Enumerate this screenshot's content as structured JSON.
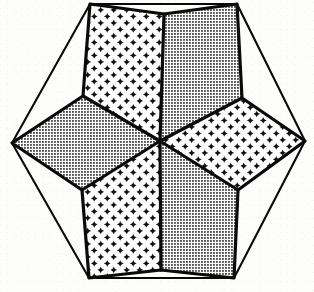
{
  "figure": {
    "type": "line-drawing",
    "width": 314,
    "height": 292,
    "background_color": "#fdfdfc",
    "ink_color": "#0a0a0a",
    "fill_background_color": "#ffffff",
    "outer_shape": {
      "name": "hexagon",
      "stroke_width_px": 2.1,
      "vertices": [
        {
          "label": "top-left",
          "x": 90,
          "y": 4
        },
        {
          "label": "top-right",
          "x": 237,
          "y": 4
        },
        {
          "label": "right",
          "x": 305,
          "y": 141
        },
        {
          "label": "bottom-right",
          "x": 234,
          "y": 278
        },
        {
          "label": "bottom-left",
          "x": 89,
          "y": 278
        },
        {
          "label": "left",
          "x": 12,
          "y": 143
        }
      ]
    },
    "inner_shape": {
      "name": "hexagram",
      "center": {
        "x": 160,
        "y": 141
      },
      "stroke_width_px": 3.2,
      "star_tips": [
        {
          "label": "tip-top-left",
          "x": 90,
          "y": 4
        },
        {
          "label": "tip-top-right",
          "x": 237,
          "y": 4
        },
        {
          "label": "tip-right",
          "x": 305,
          "y": 141
        },
        {
          "label": "tip-bottom-right",
          "x": 234,
          "y": 278
        },
        {
          "label": "tip-bottom-left",
          "x": 89,
          "y": 278
        },
        {
          "label": "tip-left",
          "x": 12,
          "y": 143
        }
      ],
      "inner_vertices": [
        {
          "label": "inner-top",
          "x": 164,
          "y": 14
        },
        {
          "label": "inner-upper-right",
          "x": 242,
          "y": 98
        },
        {
          "label": "inner-lower-right",
          "x": 238,
          "y": 190
        },
        {
          "label": "inner-bottom",
          "x": 161,
          "y": 270
        },
        {
          "label": "inner-lower-left",
          "x": 82,
          "y": 190
        },
        {
          "label": "inner-upper-left",
          "x": 83,
          "y": 96
        }
      ]
    },
    "rhombi": [
      {
        "id": "rhombus-upper-left",
        "label": "Upper left rhombus",
        "fill_pattern": "four-point-star",
        "points": [
          [
            160,
            141
          ],
          [
            83,
            96
          ],
          [
            90,
            4
          ],
          [
            164,
            14
          ]
        ]
      },
      {
        "id": "rhombus-upper-right",
        "label": "Upper right rhombus",
        "fill_pattern": "halftone-dot",
        "points": [
          [
            160,
            141
          ],
          [
            164,
            14
          ],
          [
            237,
            4
          ],
          [
            242,
            98
          ]
        ]
      },
      {
        "id": "rhombus-right",
        "label": "Right rhombus",
        "fill_pattern": "four-point-star",
        "points": [
          [
            160,
            141
          ],
          [
            242,
            98
          ],
          [
            305,
            141
          ],
          [
            238,
            190
          ]
        ]
      },
      {
        "id": "rhombus-lower-right",
        "label": "Lower right rhombus",
        "fill_pattern": "halftone-dot",
        "points": [
          [
            160,
            141
          ],
          [
            238,
            190
          ],
          [
            234,
            278
          ],
          [
            161,
            270
          ]
        ]
      },
      {
        "id": "rhombus-lower-left",
        "label": "Lower left rhombus",
        "fill_pattern": "four-point-star",
        "points": [
          [
            160,
            141
          ],
          [
            161,
            270
          ],
          [
            89,
            278
          ],
          [
            82,
            190
          ]
        ]
      },
      {
        "id": "rhombus-left",
        "label": "Left rhombus",
        "fill_pattern": "halftone-dot",
        "points": [
          [
            160,
            141
          ],
          [
            82,
            190
          ],
          [
            12,
            143
          ],
          [
            83,
            96
          ]
        ]
      }
    ],
    "thin_connector_lines": [
      {
        "id": "connector-left-to-inner-upper-left",
        "from": [
          12,
          143
        ],
        "to": [
          83,
          96
        ]
      },
      {
        "id": "connector-left-to-inner-lower-left",
        "from": [
          12,
          143
        ],
        "to": [
          82,
          190
        ]
      },
      {
        "id": "connector-right-to-inner-upper-right",
        "from": [
          305,
          141
        ],
        "to": [
          242,
          98
        ]
      },
      {
        "id": "connector-right-to-inner-lower-right",
        "from": [
          305,
          141
        ],
        "to": [
          238,
          190
        ]
      },
      {
        "id": "connector-top-left-to-inner-upper-left",
        "from": [
          90,
          4
        ],
        "to": [
          83,
          96
        ]
      },
      {
        "id": "connector-top-left-to-inner-top",
        "from": [
          90,
          4
        ],
        "to": [
          164,
          14
        ]
      },
      {
        "id": "connector-top-right-to-inner-top",
        "from": [
          237,
          4
        ],
        "to": [
          164,
          14
        ]
      },
      {
        "id": "connector-top-right-to-inner-upper-right",
        "from": [
          237,
          4
        ],
        "to": [
          242,
          98
        ]
      },
      {
        "id": "connector-bottom-left-to-inner-lower-left",
        "from": [
          89,
          278
        ],
        "to": [
          82,
          190
        ]
      },
      {
        "id": "connector-bottom-left-to-inner-bottom",
        "from": [
          89,
          278
        ],
        "to": [
          161,
          270
        ]
      },
      {
        "id": "connector-bottom-right-to-inner-bottom",
        "from": [
          234,
          278
        ],
        "to": [
          161,
          270
        ]
      },
      {
        "id": "connector-bottom-right-to-inner-lower-right",
        "from": [
          234,
          278
        ],
        "to": [
          238,
          190
        ]
      }
    ],
    "patterns": {
      "four-point-star": {
        "description": "Sparse grid of small solid four-pointed stars (concave-sided crosses) on white",
        "tile_px": 13,
        "glyph_size_px": 7,
        "color": "#111111"
      },
      "halftone-dot": {
        "description": "Dense offset grid of small solid square dots on white",
        "tile_px": 3,
        "glyph_size_px": 1.7,
        "color": "#111111"
      }
    }
  }
}
